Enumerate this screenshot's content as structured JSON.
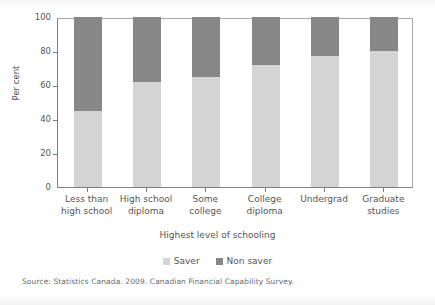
{
  "chart_data": {
    "type": "bar",
    "subtype": "stacked-100-percent",
    "title": "",
    "xlabel": "Highest level of schooling",
    "ylabel": "Per cent",
    "ylim": [
      0,
      100
    ],
    "yticks": [
      0,
      20,
      40,
      60,
      80,
      100
    ],
    "ytick_labels": [
      "0",
      "20",
      "40",
      "60",
      "80",
      "100"
    ],
    "grid": false,
    "legend_position": "bottom",
    "categories": [
      "Less than high school",
      "High school diploma",
      "Some college",
      "College diploma",
      "Undergrad",
      "Graduate studies"
    ],
    "category_lines": [
      [
        "Less than",
        "high school"
      ],
      [
        "High school",
        "diploma"
      ],
      [
        "Some",
        "college"
      ],
      [
        "College",
        "diploma"
      ],
      [
        "Undergrad",
        ""
      ],
      [
        "Graduate",
        "studies"
      ]
    ],
    "series": [
      {
        "name": "Saver",
        "color": "#d4d4d4",
        "values": [
          45,
          62,
          65,
          72,
          77,
          80
        ]
      },
      {
        "name": "Non saver",
        "color": "#878787",
        "values": [
          55,
          38,
          35,
          28,
          23,
          20
        ]
      }
    ],
    "source": "Source: Statistics Canada. 2009. Canadian Financial Capability Survey."
  },
  "colors": {
    "saver": "#d4d4d4",
    "non_saver": "#878787",
    "axis": "#808080",
    "text": "#555555",
    "background": "#ffffff"
  }
}
